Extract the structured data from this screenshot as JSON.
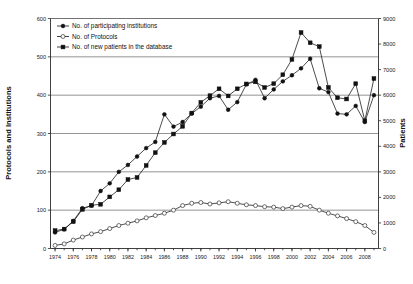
{
  "chart_data": {
    "type": "line",
    "title": "",
    "xlabel": "",
    "ylabel": "Protocols and Institutions",
    "y2label": "Patients",
    "grid": true,
    "legend_position": "top-left",
    "xlim": [
      1973.5,
      2009.5
    ],
    "ylim": [
      0,
      600
    ],
    "y2lim": [
      0,
      9000
    ],
    "yticks": [
      0,
      100,
      200,
      300,
      400,
      500,
      600
    ],
    "y2ticks": [
      0,
      1000,
      2000,
      3000,
      4000,
      5000,
      6000,
      7000,
      8000,
      9000
    ],
    "xticks": [
      1974,
      1976,
      1978,
      1980,
      1982,
      1984,
      1986,
      1988,
      1990,
      1992,
      1994,
      1996,
      1998,
      2000,
      2002,
      2004,
      2006,
      2008
    ],
    "x": [
      1974,
      1975,
      1976,
      1977,
      1978,
      1979,
      1980,
      1981,
      1982,
      1983,
      1984,
      1985,
      1986,
      1987,
      1988,
      1989,
      1990,
      1991,
      1992,
      1993,
      1994,
      1995,
      1996,
      1997,
      1998,
      1999,
      2000,
      2001,
      2002,
      2003,
      2004,
      2005,
      2006,
      2007,
      2008,
      2009
    ],
    "series": [
      {
        "name": "No. of participating institutions",
        "marker": "filled-circle",
        "axis": "left",
        "values": [
          42,
          50,
          72,
          105,
          112,
          150,
          170,
          200,
          218,
          240,
          262,
          278,
          350,
          318,
          330,
          352,
          370,
          392,
          398,
          362,
          382,
          428,
          440,
          392,
          415,
          436,
          452,
          470,
          495,
          418,
          408,
          352,
          350,
          372,
          330,
          400
        ]
      },
      {
        "name": "No. of Protocols",
        "marker": "open-circle",
        "axis": "left",
        "values": [
          8,
          12,
          22,
          30,
          38,
          44,
          52,
          60,
          66,
          72,
          80,
          86,
          92,
          100,
          112,
          118,
          120,
          116,
          119,
          122,
          118,
          114,
          112,
          109,
          108,
          104,
          108,
          112,
          110,
          100,
          92,
          85,
          78,
          70,
          60,
          42
        ]
      },
      {
        "name": "No. of new patients in the database",
        "marker": "filled-square",
        "axis": "right",
        "values": [
          700,
          760,
          1050,
          1530,
          1690,
          1730,
          2020,
          2300,
          2700,
          2780,
          3250,
          3750,
          4150,
          4480,
          4780,
          5300,
          5720,
          5980,
          6250,
          5970,
          6250,
          6440,
          6520,
          6300,
          6450,
          6800,
          7400,
          8450,
          8050,
          7900,
          6300,
          5900,
          5850,
          6450,
          5000,
          6650
        ]
      }
    ],
    "legend": [
      "No. of participating institutions",
      "No. of Protocols",
      "No. of new patients in the database"
    ]
  },
  "colors": {
    "line": "#111111",
    "grid": "#666666",
    "axis": "#2a2a2a",
    "background": "#ffffff"
  }
}
